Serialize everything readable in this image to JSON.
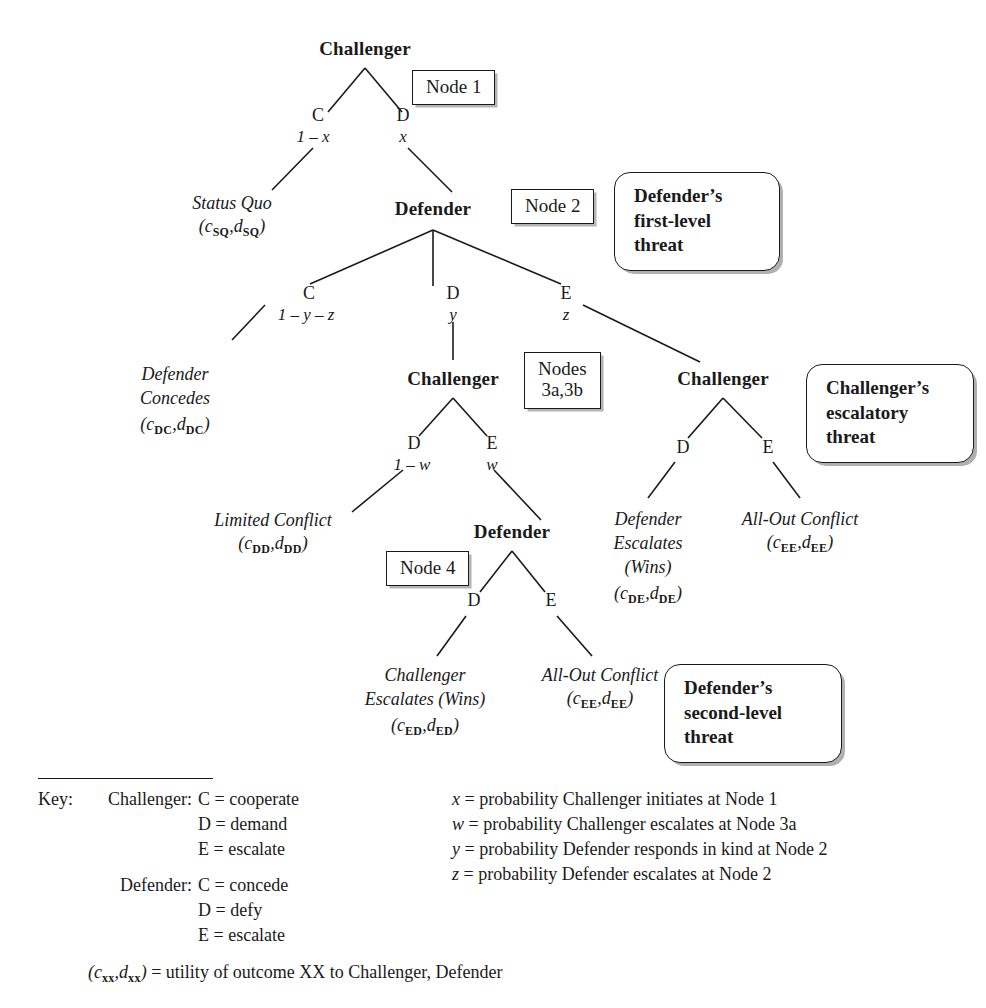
{
  "figure": {
    "type": "extensive-form-game-tree",
    "title": ""
  },
  "tree": {
    "nodes": [
      {
        "id": "n1",
        "player": "Challenger",
        "tag": "Node 1",
        "x": 365,
        "y": 50
      },
      {
        "id": "n2",
        "player": "Defender",
        "tag": "Node 2",
        "x": 433,
        "y": 212
      },
      {
        "id": "n3a",
        "player": "Challenger",
        "tag": "Nodes 3a,3b",
        "x": 453,
        "y": 382
      },
      {
        "id": "n3b",
        "player": "Challenger",
        "tag": "",
        "x": 723,
        "y": 382
      },
      {
        "id": "n4",
        "player": "Defender",
        "tag": "Node 4",
        "x": 512,
        "y": 535
      }
    ],
    "node_tags": [
      {
        "label": "Node 1",
        "lines": [
          "Node 1"
        ]
      },
      {
        "label": "Node 2",
        "lines": [
          "Node 2"
        ]
      },
      {
        "label": "Nodes 3a,3b",
        "lines": [
          "Nodes",
          "3a,3b"
        ]
      },
      {
        "label": "Node 4",
        "lines": [
          "Node 4"
        ]
      }
    ],
    "branches": [
      {
        "from": "n1",
        "action": "C",
        "prob": "1 – x",
        "to": "Status Quo"
      },
      {
        "from": "n1",
        "action": "D",
        "prob": "x",
        "to": "n2"
      },
      {
        "from": "n2",
        "action": "C",
        "prob": "1 – y – z",
        "to": "Defender Concedes"
      },
      {
        "from": "n2",
        "action": "D",
        "prob": "y",
        "to": "n3a"
      },
      {
        "from": "n2",
        "action": "E",
        "prob": "z",
        "to": "n3b"
      },
      {
        "from": "n3a",
        "action": "D",
        "prob": "1 – w",
        "to": "Limited Conflict"
      },
      {
        "from": "n3a",
        "action": "E",
        "prob": "w",
        "to": "n4"
      },
      {
        "from": "n3b",
        "action": "D",
        "prob": "",
        "to": "Defender Escalates (Wins)"
      },
      {
        "from": "n3b",
        "action": "E",
        "prob": "",
        "to": "All-Out Conflict"
      },
      {
        "from": "n4",
        "action": "D",
        "prob": "",
        "to": "Challenger Escalates (Wins)"
      },
      {
        "from": "n4",
        "action": "E",
        "prob": "",
        "to": "All-Out Conflict"
      }
    ],
    "outcomes": [
      {
        "name": "status-quo",
        "lines": [
          "Status Quo"
        ],
        "payoff_c": "SQ",
        "payoff_d": "SQ"
      },
      {
        "name": "defender-concedes",
        "lines": [
          "Defender",
          "Concedes"
        ],
        "payoff_c": "DC",
        "payoff_d": "DC"
      },
      {
        "name": "limited-conflict",
        "lines": [
          "Limited Conflict"
        ],
        "payoff_c": "DD",
        "payoff_d": "DD"
      },
      {
        "name": "defender-escalates",
        "lines": [
          "Defender",
          "Escalates",
          "(Wins)"
        ],
        "payoff_c": "DE",
        "payoff_d": "DE"
      },
      {
        "name": "all-out-conflict-3b",
        "lines": [
          "All-Out Conflict"
        ],
        "payoff_c": "EE",
        "payoff_d": "EE"
      },
      {
        "name": "challenger-escalates",
        "lines": [
          "Challenger",
          "Escalates (Wins)"
        ],
        "payoff_c": "ED",
        "payoff_d": "ED"
      },
      {
        "name": "all-out-conflict-4",
        "lines": [
          "All-Out Conflict"
        ],
        "payoff_c": "EE",
        "payoff_d": "EE"
      }
    ]
  },
  "labels": {
    "player_challenger": "Challenger",
    "player_defender": "Defender",
    "act_C": "C",
    "act_D": "D",
    "act_E": "E",
    "prob_1mx": "1 – x",
    "prob_x": "x",
    "prob_1myz": "1 – y – z",
    "prob_y": "y",
    "prob_z": "z",
    "prob_1mw": "1 – w",
    "prob_w": "w",
    "node1": "Node 1",
    "node2": "Node 2",
    "nodes3_l1": "Nodes",
    "nodes3_l2": "3a,3b",
    "node4": "Node 4",
    "out_status_quo": "Status Quo",
    "out_defender_l1": "Defender",
    "out_defender_l2": "Concedes",
    "out_limited": "Limited Conflict",
    "out_defesc_l1": "Defender",
    "out_defesc_l2": "Escalates",
    "out_defesc_l3": "(Wins)",
    "out_allout": "All-Out Conflict",
    "out_chaesc_l1": "Challenger",
    "out_chaesc_l2": "Escalates (Wins)"
  },
  "callouts": [
    {
      "name": "defenders-first-level-threat",
      "lines": [
        "Defender’s",
        "first-level",
        "threat"
      ]
    },
    {
      "name": "challengers-escalatory-threat",
      "lines": [
        "Challenger’s",
        "escalatory",
        "threat"
      ]
    },
    {
      "name": "defenders-second-level-threat",
      "lines": [
        "Defender’s",
        "second-level",
        "threat"
      ]
    }
  ],
  "key": {
    "title": "Key:",
    "groups": [
      {
        "actor": "Challenger:",
        "entries": [
          "C = cooperate",
          "D = demand",
          "E = escalate"
        ]
      },
      {
        "actor": "Defender:",
        "entries": [
          "C = concede",
          "D = defy",
          "E = escalate"
        ]
      }
    ],
    "probability_notes": [
      {
        "symbol": "x",
        "text": "= probability Challenger initiates at Node 1"
      },
      {
        "symbol": "w",
        "text": "= probability Challenger escalates at Node 3a"
      },
      {
        "symbol": "y",
        "text": "= probability Defender responds in kind at Node 2"
      },
      {
        "symbol": "z",
        "text": "= probability Defender escalates at Node 2"
      }
    ],
    "payoff_note": {
      "symbol_c": "c",
      "symbol_d": "d",
      "sub": "xx",
      "text": "= utility of outcome XX to Challenger, Defender"
    }
  }
}
